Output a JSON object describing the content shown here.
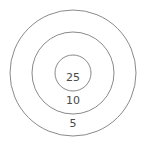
{
  "target": {
    "rings": [
      {
        "label": "5",
        "radius": 63
      },
      {
        "label": "10",
        "radius": 41
      },
      {
        "label": "25",
        "radius": 18
      }
    ],
    "stroke_color": "#8a8a8a",
    "label_color": "#4a4a4a"
  }
}
